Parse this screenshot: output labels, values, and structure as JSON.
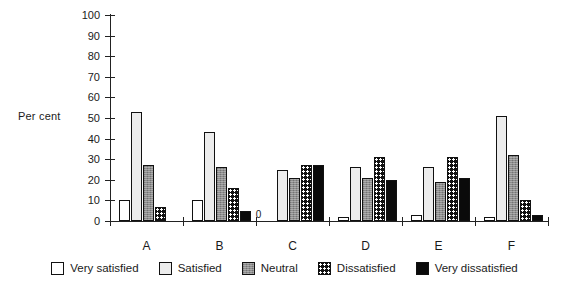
{
  "chart_data": {
    "type": "bar",
    "title": "",
    "xlabel": "",
    "ylabel": "Per cent",
    "ylim": [
      0,
      100
    ],
    "yticks": [
      0,
      10,
      20,
      30,
      40,
      50,
      60,
      70,
      80,
      90,
      100
    ],
    "categories": [
      "A",
      "B",
      "C",
      "D",
      "E",
      "F"
    ],
    "grid": false,
    "legend_position": "bottom",
    "series": [
      {
        "name": "Very satisfied",
        "fill": "white",
        "color": "#ffffff",
        "values": [
          10,
          10,
          0,
          2,
          3,
          2
        ]
      },
      {
        "name": "Satisfied",
        "fill": "light-gray",
        "color": "#ececec",
        "values": [
          53,
          43,
          25,
          26,
          26,
          51
        ]
      },
      {
        "name": "Neutral",
        "fill": "medium-gray",
        "color": "#8d8d8d",
        "values": [
          27,
          26,
          21,
          21,
          19,
          32
        ]
      },
      {
        "name": "Dissatisfied",
        "fill": "dotted-black",
        "color": "#111111",
        "values": [
          7,
          16,
          27,
          31,
          31,
          10
        ]
      },
      {
        "name": "Very dissatisfied",
        "fill": "solid-black",
        "color": "#0a0a0a",
        "values": [
          0,
          5,
          27,
          20,
          21,
          3
        ]
      }
    ],
    "annotations": [
      {
        "text": "0",
        "group": "C",
        "series": "Very satisfied",
        "note": "zero-value bar labelled 0"
      }
    ]
  }
}
